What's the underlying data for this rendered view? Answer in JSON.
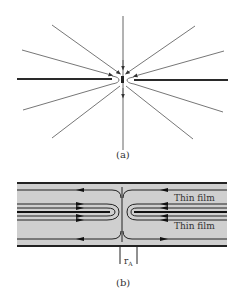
{
  "figure": {
    "panel_a": {
      "label": "(a)",
      "description": "Field lines converging toward a central point between two thick horizontal lines (thin film cross-section)"
    },
    "panel_b": {
      "label": "(b)",
      "film_labels": [
        "Thin film",
        "Thin film"
      ],
      "dimension_label": "r",
      "dimension_subscript": "A"
    },
    "colors": {
      "line": "#555555",
      "thick_line": "#2a2a2a",
      "film_fill": "#cfcfcf",
      "background": "#ffffff"
    }
  }
}
